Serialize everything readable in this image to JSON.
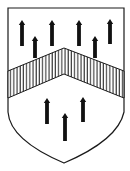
{
  "figure": {
    "title": "Heraldic shield"
  },
  "colors": {
    "field": "#ffffff",
    "outline": "#1a1a1a",
    "charge": "#111111",
    "hatch": "#1a1a1a"
  },
  "shield": {
    "top_left": [
      8,
      8
    ],
    "top_right": [
      124,
      8
    ],
    "side_bottom_y": 112,
    "tip": [
      64,
      163
    ]
  },
  "chevron": {
    "upper_apex": [
      64,
      48
    ],
    "lower_apex": [
      64,
      74
    ],
    "upper_edge_y_at_sides": 71,
    "lower_edge_y_at_sides": 98,
    "hatching": "vertical"
  },
  "charges": {
    "chief": [
      {
        "x": 22,
        "top": 20,
        "bottom": 46
      },
      {
        "x": 35,
        "top": 36,
        "bottom": 58
      },
      {
        "x": 52,
        "top": 20,
        "bottom": 46
      },
      {
        "x": 79,
        "top": 20,
        "bottom": 46
      },
      {
        "x": 95,
        "top": 36,
        "bottom": 58
      },
      {
        "x": 110,
        "top": 19,
        "bottom": 44
      }
    ],
    "base": [
      {
        "x": 47,
        "top": 98,
        "bottom": 124
      },
      {
        "x": 65,
        "top": 113,
        "bottom": 141
      },
      {
        "x": 83,
        "top": 97,
        "bottom": 122
      }
    ]
  }
}
